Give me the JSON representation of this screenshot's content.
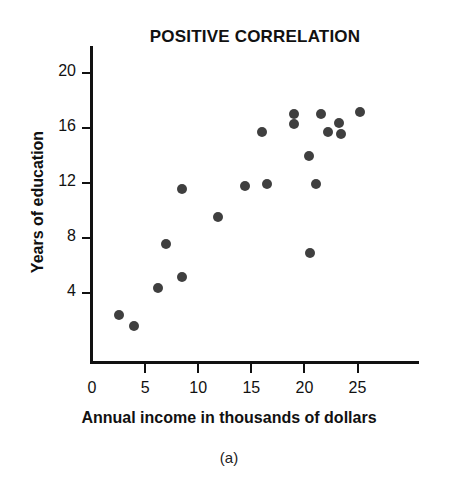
{
  "chart_data": {
    "type": "scatter",
    "title": "POSITIVE CORRELATION",
    "xlabel": "Annual income in thousands of dollars",
    "ylabel": "Years of education",
    "caption": "(a)",
    "xlim": [
      0,
      31
    ],
    "ylim": [
      0,
      21.5
    ],
    "xticks": [
      0,
      5,
      10,
      15,
      20,
      25
    ],
    "yticks": [
      4,
      8,
      12,
      16,
      20
    ],
    "xtick_labels": [
      "0",
      "5",
      "10",
      "15",
      "20",
      "25"
    ],
    "ytick_labels": [
      "4",
      "8",
      "12",
      "16",
      "20"
    ],
    "grid": false,
    "legend": null,
    "marker": {
      "shape": "circle",
      "color": "#3f3f3f",
      "size_px": 10
    },
    "points": [
      {
        "x": 2.5,
        "y": 2.4
      },
      {
        "x": 4.0,
        "y": 1.6
      },
      {
        "x": 6.2,
        "y": 4.4
      },
      {
        "x": 7.0,
        "y": 7.6
      },
      {
        "x": 8.5,
        "y": 5.2
      },
      {
        "x": 8.5,
        "y": 11.6
      },
      {
        "x": 11.9,
        "y": 9.5
      },
      {
        "x": 14.4,
        "y": 11.8
      },
      {
        "x": 16.0,
        "y": 15.7
      },
      {
        "x": 16.5,
        "y": 11.9
      },
      {
        "x": 19.0,
        "y": 17.0
      },
      {
        "x": 19.0,
        "y": 16.3
      },
      {
        "x": 20.4,
        "y": 14.0
      },
      {
        "x": 20.5,
        "y": 6.9
      },
      {
        "x": 21.1,
        "y": 11.9
      },
      {
        "x": 21.6,
        "y": 17.0
      },
      {
        "x": 22.2,
        "y": 15.7
      },
      {
        "x": 23.3,
        "y": 16.4
      },
      {
        "x": 23.4,
        "y": 15.6
      },
      {
        "x": 25.2,
        "y": 17.2
      }
    ]
  },
  "axes_geometry": {
    "x_origin_px": 92,
    "y_value4_px": 293,
    "px_per_x_unit": 10.62,
    "px_per_y_unit": 13.75
  }
}
